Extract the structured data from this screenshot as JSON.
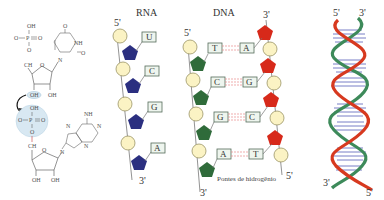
{
  "colors": {
    "phosphate_fill": "#fbf3c4",
    "phosphate_stroke": "#9a9466",
    "rna_sugar": "#2b2f80",
    "dna_sugar_left": "#2f6b3a",
    "dna_sugar_right": "#d7291a",
    "base_box_fill": "#eef5ee",
    "base_box_stroke": "#556b5a",
    "hbond": "#e88a8a",
    "helix_red": "#d7391f",
    "helix_green": "#3d8a5a",
    "helix_rung": "#6a6fc0",
    "highlight": "#d8e8f2"
  },
  "chemistry": {
    "top_nucleotide": {
      "phosphate": {
        "top": "OH",
        "left": "O",
        "center": "P",
        "right": "O",
        "bottom": "O"
      },
      "base_labels": {
        "carbonyl_top": "O",
        "nh": "NH",
        "carbonyl_right": "O",
        "n": "N"
      },
      "sugar_labels": {
        "ch2": "CH",
        "ring_o": "O",
        "oh_left": "OH",
        "oh_right": "OH"
      }
    },
    "bottom_nucleotide": {
      "phosphate": {
        "top": "OH",
        "left": "O",
        "center": "P",
        "right": "O",
        "bottom": "O"
      },
      "base_labels": {
        "nh2": "NH",
        "n1": "N",
        "n2": "N",
        "n3": "N",
        "n4": "N"
      },
      "sugar_labels": {
        "ch2": "CH",
        "ring_o": "O",
        "oh_left": "OH",
        "oh_right": "OH"
      }
    }
  },
  "rna": {
    "title": "RNA",
    "end_top": "5'",
    "end_bottom": "3'",
    "bases": [
      "U",
      "C",
      "G",
      "A"
    ]
  },
  "dna": {
    "title": "DNA",
    "left_end_top": "5'",
    "left_end_bottom": "3'",
    "right_end_top": "3'",
    "right_end_bottom": "5'",
    "left_bases": [
      "T",
      "C",
      "G",
      "A"
    ],
    "right_bases": [
      "A",
      "G",
      "C",
      "T"
    ],
    "hbond_label": "Pontes de hidrogênio"
  },
  "helix": {
    "top_left": "5'",
    "top_right": "3'",
    "bottom_left": "3'",
    "bottom_right": "5'"
  }
}
